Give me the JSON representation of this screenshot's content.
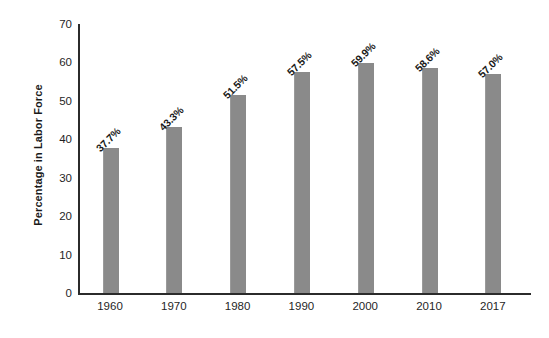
{
  "chart_data": {
    "type": "bar",
    "title": "",
    "xlabel": "",
    "ylabel": "Percentage in Labor Force",
    "categories": [
      "1960",
      "1970",
      "1980",
      "1990",
      "2000",
      "2010",
      "2017"
    ],
    "values": [
      37.7,
      43.3,
      51.5,
      57.5,
      59.9,
      58.6,
      57.0
    ],
    "value_labels": [
      "37.7%",
      "43.3%",
      "51.5%",
      "57.5%",
      "59.9%",
      "58.6%",
      "57.0%"
    ],
    "ylim": [
      0,
      70
    ],
    "ytick_labels": [
      "70",
      "60",
      "50",
      "40",
      "30",
      "20",
      "10",
      "0"
    ],
    "ytick_values": [
      70,
      60,
      50,
      40,
      30,
      20,
      10,
      0
    ],
    "grid": false,
    "legend": "none",
    "bar_color": "#8a8a8a",
    "axis_color": "#2b2b2b",
    "text_color": "#1a1a1a",
    "background_color": "#ffffff"
  }
}
